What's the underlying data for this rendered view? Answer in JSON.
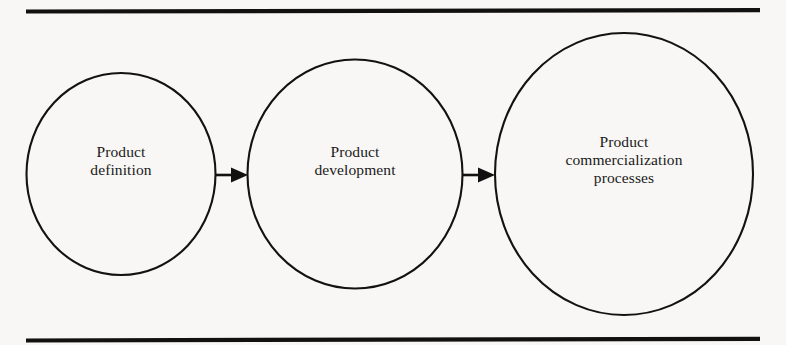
{
  "figure": {
    "type": "linear-process-flow-diagram",
    "background_color": "#f8f7f5",
    "line_color": "#111111",
    "text_color": "#1a1a1a",
    "top_rule": "horizontal-rule",
    "bottom_rule": "horizontal-rule",
    "nodes": [
      {
        "id": "product-definition",
        "shape": "ellipse",
        "label": "Product\ndefinition",
        "lines": [
          "Product",
          "definition"
        ],
        "order": 1
      },
      {
        "id": "product-development",
        "shape": "ellipse",
        "label": "Product\ndevelopment",
        "lines": [
          "Product",
          "development"
        ],
        "order": 2
      },
      {
        "id": "product-commercialization-processes",
        "shape": "ellipse",
        "label": "Product\ncommercialization\nprocesses",
        "lines": [
          "Product",
          "commercialization",
          "processes"
        ],
        "order": 3
      }
    ],
    "connectors": [
      {
        "id": "arrow-1",
        "from": "product-definition",
        "to": "product-development",
        "style": "solid-arrow-right"
      },
      {
        "id": "arrow-2",
        "from": "product-development",
        "to": "product-commercialization-processes",
        "style": "solid-arrow-right"
      }
    ]
  }
}
